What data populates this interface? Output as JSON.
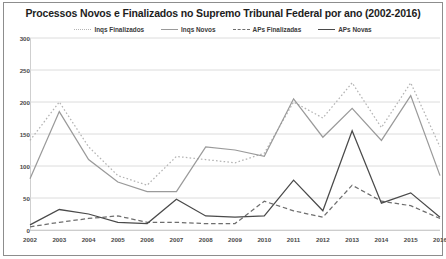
{
  "chart_data": {
    "type": "line",
    "title": "Processos Novos e Finalizados no Supremo Tribunal Federal por ano (2002-2016)",
    "xlabel": "",
    "ylabel": "",
    "ylim": [
      0,
      300
    ],
    "yticks": [
      0,
      50,
      100,
      150,
      200,
      250,
      300
    ],
    "grid": true,
    "legend_position": "top-center",
    "categories": [
      "2002",
      "2003",
      "2004",
      "2005",
      "2006",
      "2007",
      "2008",
      "2009",
      "2010",
      "2011",
      "2012",
      "2013",
      "2014",
      "2015",
      "2016"
    ],
    "series": [
      {
        "name": "Inqs Finalizados",
        "style": "dotted",
        "color": "#b4b4b4",
        "values": [
          140,
          200,
          130,
          85,
          70,
          115,
          110,
          105,
          120,
          200,
          175,
          230,
          160,
          230,
          130
        ]
      },
      {
        "name": "Inqs Novos",
        "style": "solid",
        "color": "#9a9a9a",
        "values": [
          80,
          185,
          110,
          75,
          60,
          60,
          130,
          125,
          115,
          205,
          145,
          190,
          140,
          210,
          85
        ]
      },
      {
        "name": "APs Finalizadas",
        "style": "dashed",
        "color": "#6e6e6e",
        "values": [
          5,
          12,
          18,
          22,
          12,
          12,
          10,
          10,
          45,
          30,
          20,
          70,
          45,
          38,
          18
        ]
      },
      {
        "name": "APs Novas",
        "style": "solid",
        "color": "#4a4a4a",
        "values": [
          8,
          32,
          25,
          12,
          10,
          48,
          22,
          20,
          22,
          78,
          30,
          155,
          42,
          58,
          20
        ]
      }
    ]
  }
}
